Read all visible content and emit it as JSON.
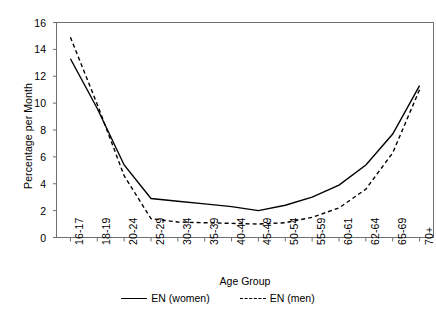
{
  "chart_data": {
    "type": "line",
    "title": "",
    "xlabel": "Age Group",
    "ylabel": "Percentage per Month",
    "categories": [
      "16-17",
      "18-19",
      "20-24",
      "25-29",
      "30-34",
      "35-39",
      "40-44",
      "45-49",
      "50-54",
      "55-59",
      "60-61",
      "62-64",
      "65-69",
      "70+"
    ],
    "ylim": [
      0,
      16
    ],
    "yticks": [
      0,
      2,
      4,
      6,
      8,
      10,
      12,
      14,
      16
    ],
    "grid": false,
    "legend_position": "bottom",
    "series": [
      {
        "name": "EN (women)",
        "style": "solid",
        "color": "#000000",
        "values": [
          13.3,
          9.6,
          5.4,
          2.9,
          2.7,
          2.5,
          2.3,
          2.0,
          2.4,
          3.0,
          3.9,
          5.4,
          7.7,
          11.3
        ]
      },
      {
        "name": "EN (men)",
        "style": "dashed",
        "color": "#000000",
        "values": [
          14.9,
          9.9,
          4.6,
          1.4,
          1.15,
          1.1,
          1.05,
          1.0,
          1.1,
          1.5,
          2.2,
          3.6,
          6.3,
          11.0
        ]
      }
    ]
  },
  "legend": {
    "items": [
      {
        "label": "EN (women)",
        "style": "solid"
      },
      {
        "label": "EN (men)",
        "style": "dashed"
      }
    ]
  }
}
